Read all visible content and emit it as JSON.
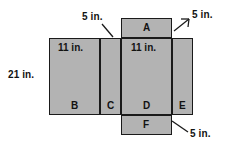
{
  "figure": {
    "fill_color": "#b3b3b3",
    "stroke_color": "#1a1a1a",
    "background_color": "#ffffff"
  },
  "faces": [
    {
      "id": "A",
      "label": "A",
      "x": 121,
      "y": 18,
      "w": 51,
      "h": 20
    },
    {
      "id": "B",
      "label": "B",
      "x": 49,
      "y": 38,
      "w": 51,
      "h": 77
    },
    {
      "id": "C",
      "label": "C",
      "x": 100,
      "y": 38,
      "w": 21,
      "h": 77
    },
    {
      "id": "D",
      "label": "D",
      "x": 121,
      "y": 38,
      "w": 51,
      "h": 77
    },
    {
      "id": "E",
      "label": "E",
      "x": 172,
      "y": 38,
      "w": 21,
      "h": 77
    },
    {
      "id": "F",
      "label": "F",
      "x": 121,
      "y": 115,
      "w": 51,
      "h": 20
    }
  ],
  "dimensions": {
    "height_left": "21 in.",
    "width_b": "11 in.",
    "width_d": "11 in.",
    "depth_top_left": "5 in.",
    "depth_top_right": "5 in.",
    "depth_bottom_right": "5 in."
  }
}
